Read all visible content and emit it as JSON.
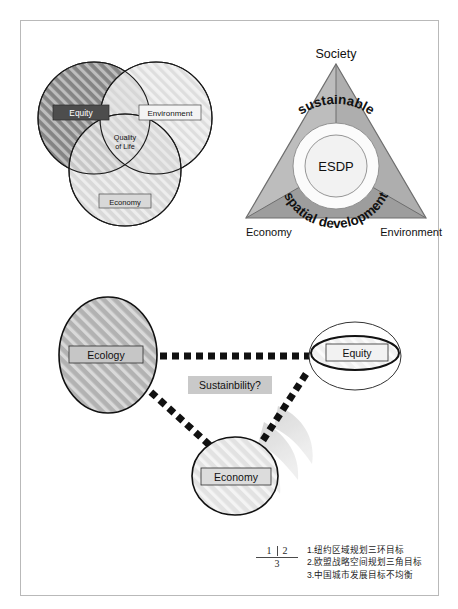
{
  "figure1": {
    "name": "venn-three-circles",
    "labels": {
      "equity": "Equity",
      "environment": "Environment",
      "economy": "Economy",
      "center_line1": "Quality",
      "center_line2": "of Life"
    },
    "colors": {
      "equity_fill": "#7a7a7a",
      "environment_fill": "#e8e8e8",
      "economy_fill": "#cfcfcf",
      "stroke": "#1a1a1a",
      "equity_box": "#4d4d4d",
      "equity_text": "#ffffff"
    }
  },
  "figure2": {
    "name": "esdp-triangle",
    "labels": {
      "top": "Society",
      "bottom_left": "Economy",
      "bottom_right": "Environment",
      "center": "ESDP",
      "ring_top": "sustainable",
      "ring_bottom": "spatial development"
    },
    "colors": {
      "triangle_fill": "#b3b3b3",
      "triangle_shade": "#9a9a9a",
      "ring_fill": "#ffffff",
      "stroke": "#6f6f6f",
      "text": "#111111"
    }
  },
  "figure3": {
    "name": "sustainability-triad",
    "labels": {
      "ecology": "Ecology",
      "equity": "Equity",
      "economy": "Economy",
      "center": "Sustainbility?"
    },
    "colors": {
      "ecology_fill": "#b0b0b0",
      "economy_fill": "#dedede",
      "equity_fill": "#ffffff",
      "link": "#111111",
      "label_box": "#c9c9c9",
      "watermark": "#dcdcdc",
      "stroke": "#1a1a1a"
    }
  },
  "caption": {
    "key": {
      "one": "1",
      "two": "2",
      "three": "3"
    },
    "lines": [
      "1.纽约区域规划三环目标",
      "2.欧盟战略空间规划三角目标",
      "3.中国城市发展目标不均衡"
    ]
  }
}
